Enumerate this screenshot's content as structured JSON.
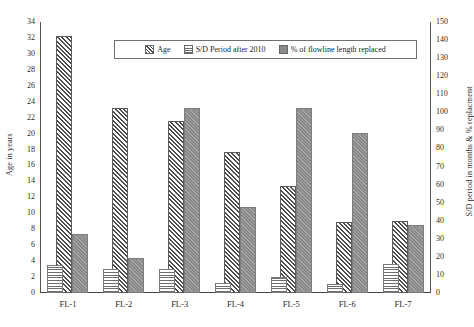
{
  "chart_data": {
    "type": "bar",
    "title": "",
    "categories": [
      "FL-1",
      "FL-2",
      "FL-3",
      "FL-4",
      "FL-5",
      "FL-6",
      "FL-7"
    ],
    "series": [
      {
        "name": "Age",
        "axis": "left",
        "unit": "years",
        "values": [
          32.0,
          23.0,
          21.3,
          17.5,
          13.2,
          8.7,
          8.8
        ]
      },
      {
        "name": "S/D Period after 2010",
        "axis": "right",
        "unit": "months",
        "values": [
          14,
          12,
          12,
          4,
          8,
          4,
          15
        ]
      },
      {
        "name": "% of flowline length replaced",
        "axis": "right",
        "unit": "%",
        "values": [
          32,
          18,
          101,
          46,
          101,
          87,
          36
        ]
      }
    ],
    "series_left_scale_values": {
      "S/D Period after 2010": [
        3.3,
        2.7,
        2.7,
        1.0,
        1.8,
        0.9,
        3.4
      ],
      "% of flowline length replaced": [
        7.2,
        4.1,
        22.9,
        10.5,
        23.0,
        19.8,
        8.3
      ]
    },
    "xlabel": "",
    "ylabel_left": "Age in years",
    "ylabel_right": "S/D period in months & % replacment",
    "ylim_left": [
      0,
      34
    ],
    "ytick_step_left": 2,
    "ylim_right": [
      0,
      150
    ],
    "ytick_step_right": 10,
    "yticks_left": [
      "34",
      "32",
      "30",
      "28",
      "26",
      "24",
      "22",
      "20",
      "18",
      "16",
      "14",
      "12",
      "10",
      "8",
      "6",
      "4",
      "2",
      "0"
    ],
    "yticks_right": [
      "150",
      "140",
      "130",
      "120",
      "110",
      "100",
      "90",
      "80",
      "70",
      "60",
      "50",
      "40",
      "30",
      "20",
      "10",
      "0"
    ],
    "grid": false,
    "legend_position": "top-center",
    "colors": {
      "age": "#4b4b4b",
      "sd": "#6d6d6d",
      "pct": "#8e8e8e",
      "axis": "#555555"
    }
  },
  "legend": {
    "items": [
      {
        "label": "Age",
        "key": "age"
      },
      {
        "label": "S/D Period after 2010",
        "key": "sd"
      },
      {
        "label": "% of flowline length replaced",
        "key": "pct"
      }
    ]
  }
}
